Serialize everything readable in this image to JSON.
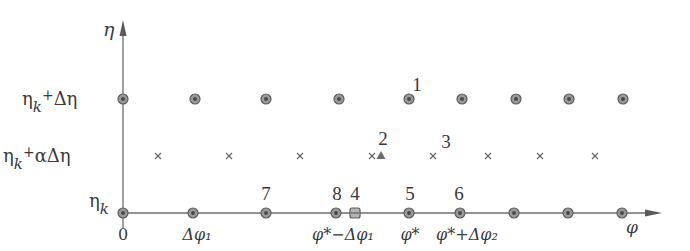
{
  "axes": {
    "y_label": "η",
    "x_label": "φ",
    "origin_label": "0"
  },
  "rows": [
    {
      "id": "top",
      "label_main": "η",
      "label_sub": "k",
      "label_rest": "+Δη",
      "y": 99
    },
    {
      "id": "middle",
      "label_main": "η",
      "label_sub": "k",
      "label_rest": "+αΔη",
      "y": 156
    },
    {
      "id": "bottom",
      "label_main": "η",
      "label_sub": "k",
      "label_rest": "",
      "y": 213
    }
  ],
  "x_ticks": [
    {
      "label": "0",
      "x": 123
    },
    {
      "label": "Δφ₁",
      "x": 197
    },
    {
      "label": "φ*−Δφ₁",
      "x": 343
    },
    {
      "label": "φ*",
      "x": 410
    },
    {
      "label": "φ*+Δφ₂",
      "x": 467
    }
  ],
  "top_row_points": [
    123,
    195,
    266,
    339,
    409,
    462,
    516,
    569,
    623
  ],
  "middle_row_crosses": [
    158,
    229,
    300,
    372,
    433,
    488,
    540,
    595
  ],
  "middle_row_triangle": 381,
  "bottom_row_points": [
    123,
    193,
    266,
    336,
    409,
    460,
    514,
    568,
    622
  ],
  "bottom_row_square": 355,
  "numbered_labels": [
    {
      "n": "1",
      "x": 417,
      "y": 91
    },
    {
      "n": "2",
      "x": 383,
      "y": 145
    },
    {
      "n": "3",
      "x": 446,
      "y": 148
    },
    {
      "n": "4",
      "x": 355,
      "y": 200
    },
    {
      "n": "5",
      "x": 410,
      "y": 200
    },
    {
      "n": "6",
      "x": 459,
      "y": 200
    },
    {
      "n": "7",
      "x": 266,
      "y": 200
    },
    {
      "n": "8",
      "x": 337,
      "y": 200
    }
  ],
  "colors": {
    "ink": "#3a3a3a",
    "axis": "#6e6e6e",
    "node": "#9a9a9a"
  }
}
